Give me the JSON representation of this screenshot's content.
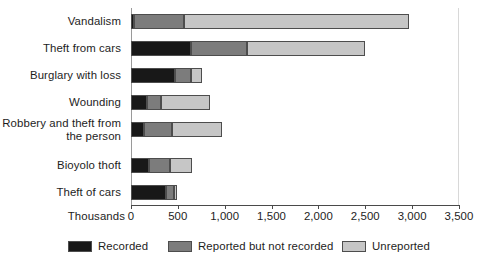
{
  "chart_data": {
    "type": "bar",
    "orientation": "horizontal",
    "stacked": true,
    "title": "",
    "xlabel": "Thousands",
    "ylabel": "",
    "xlim": [
      0,
      3500
    ],
    "xticks": [
      0,
      500,
      1000,
      1500,
      2000,
      2500,
      3000,
      3500
    ],
    "xtick_labels": [
      "0",
      "500",
      "1,000",
      "1,500",
      "2,000",
      "2,500",
      "3,000",
      "3,500"
    ],
    "grid": false,
    "legend_position": "bottom",
    "categories": [
      "Vandalism",
      "Theft from cars",
      "Burglary with loss",
      "Wounding",
      "Robbery and theft from\nthe person",
      "Bioyolo thoft",
      "Theft of cars"
    ],
    "series": [
      {
        "name": "Recorded",
        "color": "#181818",
        "values": [
          32,
          645,
          467,
          174,
          139,
          189,
          378
        ]
      },
      {
        "name": "Reported but not recorded",
        "color": "#7c7c7c",
        "values": [
          535,
          588,
          178,
          151,
          299,
          224,
          82
        ]
      },
      {
        "name": "Unreported",
        "color": "#c6c6c6",
        "values": [
          2396,
          1266,
          114,
          517,
          528,
          239,
          36
        ]
      }
    ],
    "totals": [
      2963,
      2499,
      759,
      842,
      966,
      652,
      496
    ]
  },
  "legend": {
    "items": [
      {
        "label": "Recorded",
        "color": "#181818"
      },
      {
        "label": "Reported but not recorded",
        "color": "#7c7c7c"
      },
      {
        "label": "Unreported",
        "color": "#c6c6c6"
      }
    ]
  },
  "axis": {
    "unit_label": "Thousands"
  }
}
